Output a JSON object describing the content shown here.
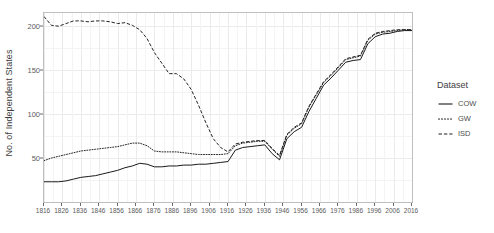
{
  "chart_data": {
    "type": "line",
    "title": "",
    "xlabel": "",
    "ylabel": "No. of Independent States",
    "xlim": [
      1816,
      2016
    ],
    "ylim": [
      0,
      215
    ],
    "grid": true,
    "legend_position": "right",
    "legend_title": "Dataset",
    "x_ticks": [
      1816,
      1826,
      1836,
      1846,
      1856,
      1866,
      1876,
      1886,
      1896,
      1906,
      1916,
      1926,
      1936,
      1946,
      1956,
      1966,
      1976,
      1986,
      1996,
      2006,
      2016
    ],
    "x_tick_labels": [
      "1816",
      "1826",
      "1836",
      "1846",
      "1856",
      "1866",
      "1876",
      "1886",
      "1896",
      "1906",
      "1916",
      "1926",
      "1936",
      "1946",
      "1956",
      "1966",
      "1976",
      "1986",
      "1996",
      "2006",
      "2016"
    ],
    "y_ticks": [
      50,
      100,
      150,
      200
    ],
    "y_tick_labels": [
      "50",
      "100",
      "150",
      "200"
    ],
    "series": [
      {
        "name": "COW",
        "linestyle": "solid",
        "color": "#1a1a1a",
        "x": [
          1816,
          1820,
          1824,
          1828,
          1832,
          1836,
          1840,
          1844,
          1848,
          1852,
          1856,
          1860,
          1864,
          1868,
          1872,
          1876,
          1880,
          1884,
          1888,
          1892,
          1896,
          1900,
          1904,
          1908,
          1912,
          1916,
          1920,
          1924,
          1928,
          1932,
          1936,
          1940,
          1944,
          1948,
          1952,
          1956,
          1960,
          1964,
          1968,
          1972,
          1976,
          1980,
          1984,
          1988,
          1992,
          1996,
          2000,
          2004,
          2008,
          2012,
          2016
        ],
        "values": [
          23,
          23,
          23,
          24,
          26,
          28,
          29,
          30,
          32,
          34,
          36,
          39,
          41,
          44,
          43,
          40,
          40,
          41,
          41,
          42,
          42,
          43,
          43,
          44,
          45,
          46,
          59,
          62,
          63,
          64,
          65,
          55,
          48,
          72,
          80,
          85,
          103,
          118,
          133,
          141,
          150,
          159,
          161,
          162,
          180,
          188,
          191,
          192,
          194,
          195,
          195
        ]
      },
      {
        "name": "GW",
        "linestyle": "dotted",
        "color": "#1a1a1a",
        "x": [
          1816,
          1820,
          1824,
          1828,
          1832,
          1836,
          1840,
          1844,
          1848,
          1852,
          1856,
          1860,
          1864,
          1868,
          1872,
          1876,
          1880,
          1884,
          1888,
          1892,
          1896,
          1900,
          1904,
          1908,
          1912,
          1916,
          1920,
          1924,
          1928,
          1932,
          1936,
          1940,
          1944,
          1948,
          1952,
          1956,
          1960,
          1964,
          1968,
          1972,
          1976,
          1980,
          1984,
          1988,
          1992,
          1996,
          2000,
          2004,
          2008,
          2012,
          2016
        ],
        "values": [
          47,
          50,
          52,
          54,
          56,
          58,
          59,
          60,
          61,
          62,
          63,
          65,
          67,
          67,
          64,
          58,
          57,
          57,
          57,
          56,
          55,
          54,
          54,
          54,
          54,
          55,
          64,
          67,
          68,
          69,
          69,
          60,
          52,
          76,
          84,
          89,
          108,
          122,
          136,
          144,
          153,
          162,
          164,
          166,
          184,
          191,
          193,
          194,
          195,
          196,
          196
        ]
      },
      {
        "name": "ISD",
        "linestyle": "dashed",
        "color": "#1a1a1a",
        "x": [
          1816,
          1820,
          1824,
          1828,
          1832,
          1836,
          1840,
          1844,
          1848,
          1852,
          1856,
          1860,
          1864,
          1868,
          1872,
          1876,
          1880,
          1884,
          1888,
          1892,
          1896,
          1900,
          1904,
          1908,
          1912,
          1916,
          1920,
          1924,
          1928,
          1932,
          1936,
          1940,
          1944,
          1948,
          1952,
          1956,
          1960,
          1964,
          1968,
          1972,
          1976,
          1980,
          1984,
          1988,
          1992,
          1996,
          2000,
          2004,
          2008,
          2012,
          2016
        ],
        "values": [
          211,
          201,
          200,
          203,
          206,
          206,
          205,
          206,
          206,
          205,
          203,
          204,
          201,
          196,
          186,
          170,
          158,
          146,
          146,
          140,
          128,
          110,
          90,
          72,
          62,
          57,
          66,
          68,
          69,
          70,
          70,
          61,
          53,
          77,
          85,
          90,
          109,
          123,
          137,
          145,
          154,
          163,
          165,
          167,
          185,
          192,
          194,
          195,
          196,
          196,
          196
        ]
      }
    ]
  },
  "legend": {
    "title": "Dataset",
    "items": [
      {
        "label": "COW",
        "style": "solid"
      },
      {
        "label": "GW",
        "style": "dotted"
      },
      {
        "label": "ISD",
        "style": "dashed"
      }
    ]
  },
  "axes": {
    "y_title": "No. of Independent States"
  }
}
